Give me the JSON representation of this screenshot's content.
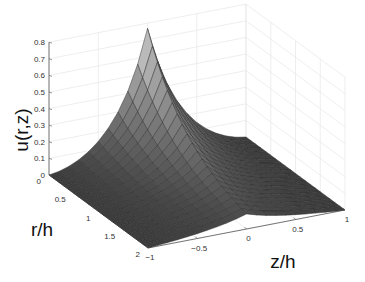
{
  "chart_data": {
    "type": "surface",
    "title": "",
    "xlabel": "z/h",
    "ylabel": "r/h",
    "zlabel": "u(r,z)",
    "x_ticks": [
      "-1",
      "-0.5",
      "0",
      "0.5",
      "1"
    ],
    "y_ticks": [
      "0",
      "0.5",
      "1",
      "1.5",
      "2"
    ],
    "z_ticks": [
      "0",
      "0.1",
      "0.2",
      "0.3",
      "0.4",
      "0.5",
      "0.6",
      "0.7",
      "0.8"
    ],
    "xlim": [
      -1,
      1
    ],
    "ylim": [
      0,
      2
    ],
    "zlim": [
      0,
      0.8
    ],
    "grid": true,
    "colormap": "gray",
    "peak": {
      "r": 0,
      "z": 0,
      "u": 0.72
    },
    "grid_resolution": {
      "r": 20,
      "z": 20
    }
  }
}
